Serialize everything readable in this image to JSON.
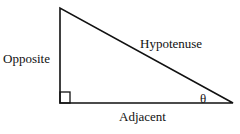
{
  "diagram": {
    "labels": {
      "opposite": "Opposite",
      "hypotenuse": "Hypotenuse",
      "adjacent": "Adjacent",
      "angle": "θ"
    },
    "vertices": {
      "top": [
        60,
        8
      ],
      "right_angle": [
        60,
        103
      ],
      "angle_vertex": [
        233,
        103
      ]
    },
    "stroke_color": "#111111"
  }
}
